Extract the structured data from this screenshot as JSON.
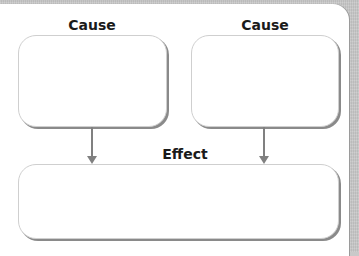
{
  "diagram": {
    "type": "cause-effect organizer",
    "causes": [
      {
        "label": "Cause",
        "content": ""
      },
      {
        "label": "Cause",
        "content": ""
      }
    ],
    "effect": {
      "label": "Effect",
      "content": ""
    },
    "colors": {
      "box_border": "#cfcfcf",
      "box_shadow": "#8a8a8a",
      "arrow": "#808080",
      "background": "#c9c9c9",
      "panel": "#ffffff"
    }
  }
}
